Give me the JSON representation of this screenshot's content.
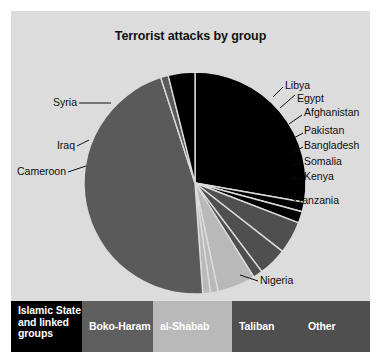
{
  "chart_data": {
    "type": "pie",
    "title": "Terrorist attacks by group",
    "xlabel": "",
    "ylabel": "",
    "legend_position": "bottom",
    "grid": false,
    "categories": [
      "Syria",
      "Libya",
      "Egypt",
      "Afghanistan",
      "Pakistan",
      "Bangladesh",
      "Somalia",
      "Kenya",
      "Tanzania",
      "Nigeria",
      "Cameroon",
      "Iraq"
    ],
    "values": [
      27.8,
      1.4,
      1.7,
      4.7,
      4.2,
      1.4,
      5.6,
      1.1,
      1.1,
      46.1,
      1.1,
      3.8
    ],
    "slices": [
      {
        "label": "Syria",
        "value": 27.8,
        "group": "Islamic State and linked groups",
        "color": "#000000",
        "start_angle": 0,
        "end_angle": 100.0
      },
      {
        "label": "Libya",
        "value": 1.4,
        "group": "Islamic State and linked groups",
        "color": "#000000",
        "start_angle": 100.0,
        "end_angle": 105.0
      },
      {
        "label": "Egypt",
        "value": 1.7,
        "group": "Islamic State and linked groups",
        "color": "#000000",
        "start_angle": 105.0,
        "end_angle": 111.0
      },
      {
        "label": "Afghanistan",
        "value": 4.7,
        "group": "Taliban",
        "color": "#4f4f4f",
        "start_angle": 111.0,
        "end_angle": 128.0
      },
      {
        "label": "Pakistan",
        "value": 4.2,
        "group": "Taliban",
        "color": "#4f4f4f",
        "start_angle": 128.0,
        "end_angle": 143.0
      },
      {
        "label": "Bangladesh",
        "value": 1.4,
        "group": "Other",
        "color": "#4f4f4f",
        "start_angle": 143.0,
        "end_angle": 148.0
      },
      {
        "label": "Somalia",
        "value": 5.6,
        "group": "al-Shabab",
        "color": "#b9b9b9",
        "start_angle": 148.0,
        "end_angle": 168.0
      },
      {
        "label": "Kenya",
        "value": 1.1,
        "group": "al-Shabab",
        "color": "#b9b9b9",
        "start_angle": 168.0,
        "end_angle": 172.0
      },
      {
        "label": "Tanzania",
        "value": 1.1,
        "group": "al-Shabab",
        "color": "#b9b9b9",
        "start_angle": 172.0,
        "end_angle": 176.0
      },
      {
        "label": "Nigeria",
        "value": 46.1,
        "group": "Boko-Haram",
        "color": "#5a5a5a",
        "start_angle": 176.0,
        "end_angle": 342.0
      },
      {
        "label": "Cameroon",
        "value": 1.1,
        "group": "Boko-Haram",
        "color": "#5a5a5a",
        "start_angle": 342.0,
        "end_angle": 346.0
      },
      {
        "label": "Iraq",
        "value": 3.8,
        "group": "Islamic State and linked groups",
        "color": "#000000",
        "start_angle": 346.0,
        "end_angle": 360.0
      }
    ],
    "legend": [
      {
        "label": "Islamic State and linked groups",
        "color": "#000000"
      },
      {
        "label": "Boko-Haram",
        "color": "#5e5e5e"
      },
      {
        "label": "al-Shabab",
        "color": "#b9b9b9"
      },
      {
        "label": "Taliban",
        "color": "#4f4f4f"
      },
      {
        "label": "Other",
        "color": "#4f4f4f"
      }
    ]
  },
  "labels": {
    "syria": "Syria",
    "iraq": "Iraq",
    "cameroon": "Cameroon",
    "libya": "Libya",
    "egypt": "Egypt",
    "afghanistan": "Afghanistan",
    "pakistan": "Pakistan",
    "bangladesh": "Bangladesh",
    "somalia": "Somalia",
    "kenya": "Kenya",
    "tanzania": "Tanzania",
    "nigeria": "Nigeria"
  },
  "legend": {
    "islamic_state": "Islamic State and linked groups",
    "boko_haram": "Boko-Haram",
    "al_shabab": "al-Shabab",
    "taliban": "Taliban",
    "other": "Other"
  },
  "colors": {
    "background": "#dcdcdc",
    "page": "#ffffff",
    "black": "#000000",
    "boko_gray": "#5a5a5a",
    "light_gray": "#b9b9b9",
    "dark_gray": "#4f4f4f",
    "text": "#0d0d0d"
  }
}
